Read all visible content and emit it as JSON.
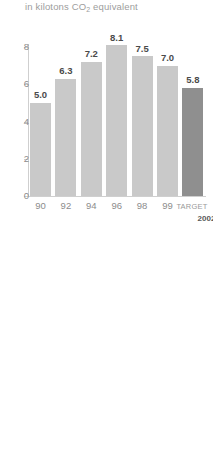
{
  "chart_data": {
    "type": "bar",
    "title": "",
    "subtitle_prefix": "in kilotons CO",
    "subtitle_sub": "2",
    "subtitle_suffix": " equivalent",
    "subtitle": "in kilotons CO2 equivalent",
    "xlabel": "",
    "ylabel": "",
    "ylim": [
      0,
      8.6
    ],
    "yticks": [
      0,
      2,
      4,
      6,
      8
    ],
    "ytick_labels": [
      "0",
      "2",
      "4",
      "6",
      "8"
    ],
    "grid": false,
    "legend": false,
    "categories": [
      "90",
      "92",
      "94",
      "96",
      "98",
      "99",
      "TARGET"
    ],
    "values": [
      5.0,
      6.3,
      7.2,
      8.1,
      7.5,
      7.0,
      5.8
    ],
    "value_labels": [
      "5.0",
      "6.3",
      "7.2",
      "8.1",
      "7.5",
      "7.0",
      "5.8"
    ],
    "bars": [
      {
        "category": "90",
        "value": 5.0,
        "label": "5.0",
        "color": "#c9c9c9",
        "highlight": false
      },
      {
        "category": "92",
        "value": 6.3,
        "label": "6.3",
        "color": "#c9c9c9",
        "highlight": false
      },
      {
        "category": "94",
        "value": 7.2,
        "label": "7.2",
        "color": "#c9c9c9",
        "highlight": false
      },
      {
        "category": "96",
        "value": 8.1,
        "label": "8.1",
        "color": "#c9c9c9",
        "highlight": false
      },
      {
        "category": "98",
        "value": 7.5,
        "label": "7.5",
        "color": "#c9c9c9",
        "highlight": false
      },
      {
        "category": "99",
        "value": 7.0,
        "label": "7.0",
        "color": "#c9c9c9",
        "highlight": false
      },
      {
        "category": "TARGET",
        "value": 5.8,
        "label": "5.8",
        "color": "#8f8f8f",
        "highlight": true
      }
    ],
    "target_label": "TARGET",
    "target_year": "2002",
    "colors": {
      "bar": "#c9c9c9",
      "bar_target": "#8f8f8f",
      "axis": "#cfcfcf",
      "tick_text": "#8c8c8c",
      "value_text": "#4a4a4a",
      "subtitle_text": "#9d9d9d",
      "background": "#ffffff"
    }
  }
}
